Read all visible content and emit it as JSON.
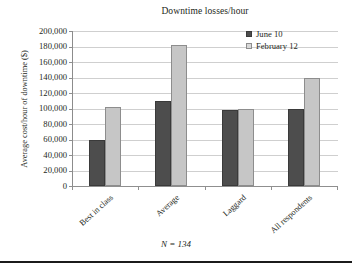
{
  "chart_data": {
    "type": "bar",
    "title": "Downtime losses/hour",
    "xlabel": "",
    "ylabel": "Average cost/hour of downtime ($)",
    "categories": [
      "Best in class",
      "Average",
      "Laggard",
      "All respondents"
    ],
    "series": [
      {
        "name": "June 10",
        "color": "#4d4d4d",
        "values": [
          60000,
          110000,
          98000,
          99000
        ]
      },
      {
        "name": "February 12",
        "color": "#c6c6c6",
        "values": [
          102000,
          182000,
          100000,
          139000
        ]
      }
    ],
    "ylim": [
      0,
      200000
    ],
    "ytick_step": 20000,
    "ytick_labels": [
      "200,000",
      "180,000",
      "160,000",
      "140,000",
      "120,000",
      "100,000",
      "80,000",
      "60,000",
      "40,000",
      "20,000",
      "0"
    ],
    "ytick_values": [
      200000,
      180000,
      160000,
      140000,
      120000,
      100000,
      80000,
      60000,
      40000,
      20000,
      0
    ],
    "grid": true,
    "legend_position": "top-right",
    "annotations": [
      "N = 134"
    ]
  },
  "figure": {
    "title": "Downtime losses/hour",
    "y_axis_title": "Average cost/hour of downtime ($)",
    "footnote": "N = 134"
  },
  "legend": {
    "entries": [
      {
        "label": "June 10",
        "swatch": "dark-square-icon"
      },
      {
        "label": "February 12",
        "swatch": "light-square-icon"
      }
    ]
  }
}
